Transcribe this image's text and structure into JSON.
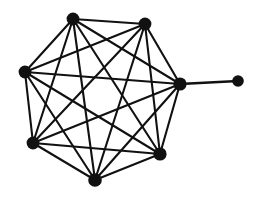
{
  "figure": {
    "background_color": "#ffffff",
    "width": 260,
    "height": 199
  },
  "style": {
    "edge_color": "#111111",
    "node_color": "#111111",
    "edge_width": 2.1,
    "pendant_edge_width": 2.3
  },
  "chart_data": {
    "type": "diagram",
    "subtype": "node-link-graph",
    "directed": false,
    "weighted": false,
    "node_count": 8,
    "edge_count": 22,
    "layout": "circular-heptagon-with-pendant",
    "xlim": [
      0,
      260
    ],
    "ylim": [
      0,
      199
    ],
    "grid": false,
    "legend": null,
    "nodes": [
      {
        "id": "v1",
        "label": "top-left",
        "x": 73,
        "y": 19,
        "r": 6.4,
        "degree": 6
      },
      {
        "id": "v2",
        "label": "top-right",
        "x": 145,
        "y": 24,
        "r": 6.4,
        "degree": 6
      },
      {
        "id": "v3",
        "label": "right-hub",
        "x": 180,
        "y": 84,
        "r": 6.6,
        "degree": 7
      },
      {
        "id": "v4",
        "label": "bottom-right",
        "x": 160,
        "y": 154,
        "r": 6.6,
        "degree": 6
      },
      {
        "id": "v5",
        "label": "bottom",
        "x": 95,
        "y": 180,
        "r": 6.8,
        "degree": 6
      },
      {
        "id": "v6",
        "label": "bottom-left",
        "x": 33,
        "y": 143,
        "r": 6.4,
        "degree": 6
      },
      {
        "id": "v7",
        "label": "left",
        "x": 25,
        "y": 72,
        "r": 6.4,
        "degree": 6
      },
      {
        "id": "v8",
        "label": "pendant",
        "x": 238,
        "y": 81,
        "r": 5.8,
        "degree": 1
      }
    ],
    "edges": [
      {
        "source": "v1",
        "target": "v2",
        "kind": "ring"
      },
      {
        "source": "v2",
        "target": "v3",
        "kind": "ring"
      },
      {
        "source": "v3",
        "target": "v4",
        "kind": "ring"
      },
      {
        "source": "v4",
        "target": "v5",
        "kind": "ring"
      },
      {
        "source": "v5",
        "target": "v6",
        "kind": "ring"
      },
      {
        "source": "v6",
        "target": "v7",
        "kind": "ring"
      },
      {
        "source": "v7",
        "target": "v1",
        "kind": "ring"
      },
      {
        "source": "v1",
        "target": "v3",
        "kind": "chord"
      },
      {
        "source": "v1",
        "target": "v4",
        "kind": "chord"
      },
      {
        "source": "v1",
        "target": "v5",
        "kind": "chord"
      },
      {
        "source": "v1",
        "target": "v6",
        "kind": "chord"
      },
      {
        "source": "v2",
        "target": "v4",
        "kind": "chord"
      },
      {
        "source": "v2",
        "target": "v5",
        "kind": "chord"
      },
      {
        "source": "v2",
        "target": "v6",
        "kind": "chord"
      },
      {
        "source": "v2",
        "target": "v7",
        "kind": "chord"
      },
      {
        "source": "v3",
        "target": "v5",
        "kind": "chord"
      },
      {
        "source": "v3",
        "target": "v6",
        "kind": "chord"
      },
      {
        "source": "v3",
        "target": "v7",
        "kind": "chord"
      },
      {
        "source": "v4",
        "target": "v6",
        "kind": "chord"
      },
      {
        "source": "v4",
        "target": "v7",
        "kind": "chord"
      },
      {
        "source": "v5",
        "target": "v7",
        "kind": "chord"
      },
      {
        "source": "v3",
        "target": "v8",
        "kind": "pendant"
      }
    ]
  }
}
